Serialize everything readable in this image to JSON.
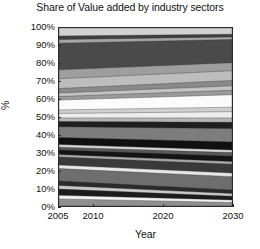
{
  "chart_data": {
    "type": "area",
    "title": "Share of Value added by industry sectors",
    "subtitle": "",
    "xlabel": "Year",
    "ylabel": "%",
    "grid": false,
    "legend_position": "none",
    "stacked": true,
    "normalized_percent": true,
    "xlim": [
      2005,
      2030
    ],
    "ylim": [
      0,
      100
    ],
    "xticks": [
      2005,
      2010,
      2020,
      2030
    ],
    "xtick_labels": [
      "2005",
      "2010",
      "2020",
      "2030"
    ],
    "yticks": [
      0,
      10,
      20,
      30,
      40,
      50,
      60,
      70,
      80,
      90,
      100
    ],
    "ytick_labels": [
      "0%",
      "10%",
      "20%",
      "30%",
      "40%",
      "50%",
      "60%",
      "70%",
      "80%",
      "90%",
      "100%"
    ],
    "x": [
      2005,
      2030
    ],
    "note": "Grayscale stacked percentage area chart; values are cumulative upper boundaries of each band read off the y-axis at the left (2005) and right (2030) edges.",
    "series": [
      {
        "name": "sector-01",
        "color": "#8f8f8f",
        "cum_start": 4.0,
        "cum_end": 2.0
      },
      {
        "name": "sector-02",
        "color": "#f2f2f2",
        "cum_start": 6.0,
        "cum_end": 3.4
      },
      {
        "name": "sector-03",
        "color": "#1c1c1c",
        "cum_start": 9.5,
        "cum_end": 5.5
      },
      {
        "name": "sector-04",
        "color": "#c9c9c9",
        "cum_start": 11.5,
        "cum_end": 7.0
      },
      {
        "name": "sector-05",
        "color": "#2b2b2b",
        "cum_start": 14.0,
        "cum_end": 9.0
      },
      {
        "name": "sector-06",
        "color": "#6e6e6e",
        "cum_start": 21.0,
        "cum_end": 16.5
      },
      {
        "name": "sector-07",
        "color": "#e8e8e8",
        "cum_start": 23.0,
        "cum_end": 18.5
      },
      {
        "name": "sector-08",
        "color": "#3a3a3a",
        "cum_start": 27.5,
        "cum_end": 23.5
      },
      {
        "name": "sector-09",
        "color": "#a8a8a8",
        "cum_start": 29.0,
        "cum_end": 25.0
      },
      {
        "name": "sector-10",
        "color": "#141414",
        "cum_start": 31.5,
        "cum_end": 28.0
      },
      {
        "name": "sector-11",
        "color": "#585858",
        "cum_start": 33.0,
        "cum_end": 30.0
      },
      {
        "name": "sector-12",
        "color": "#d6d6d6",
        "cum_start": 34.5,
        "cum_end": 31.5
      },
      {
        "name": "sector-13",
        "color": "#101010",
        "cum_start": 38.5,
        "cum_end": 36.0
      },
      {
        "name": "sector-14",
        "color": "#7d7d7d",
        "cum_start": 44.5,
        "cum_end": 43.5
      },
      {
        "name": "sector-15",
        "color": "#1f1f1f",
        "cum_start": 47.5,
        "cum_end": 47.0
      },
      {
        "name": "sector-16",
        "color": "#b5b5b5",
        "cum_start": 49.5,
        "cum_end": 49.5
      },
      {
        "name": "sector-17",
        "color": "#ededed",
        "cum_start": 52.0,
        "cum_end": 53.0
      },
      {
        "name": "sector-18",
        "color": "#cfcfcf",
        "cum_start": 54.0,
        "cum_end": 55.5
      },
      {
        "name": "sector-19",
        "color": "#fbfbfb",
        "cum_start": 59.5,
        "cum_end": 62.5
      },
      {
        "name": "sector-20",
        "color": "#9a9a9a",
        "cum_start": 61.5,
        "cum_end": 65.0
      },
      {
        "name": "sector-21",
        "color": "#c2c2c2",
        "cum_start": 63.5,
        "cum_end": 67.5
      },
      {
        "name": "sector-22",
        "color": "#8a8a8a",
        "cum_start": 66.0,
        "cum_end": 70.5
      },
      {
        "name": "sector-23",
        "color": "#bdbdbd",
        "cum_start": 71.5,
        "cum_end": 76.0
      },
      {
        "name": "sector-24",
        "color": "#9e9e9e",
        "cum_start": 76.5,
        "cum_end": 80.5
      },
      {
        "name": "sector-25",
        "color": "#4a4a4a",
        "cum_start": 91.5,
        "cum_end": 93.5
      },
      {
        "name": "sector-26",
        "color": "#a5a5a5",
        "cum_start": 93.5,
        "cum_end": 95.0
      },
      {
        "name": "sector-27",
        "color": "#3f3f3f",
        "cum_start": 95.5,
        "cum_end": 96.5
      },
      {
        "name": "sector-28",
        "color": "#d2d2d2",
        "cum_start": 100.0,
        "cum_end": 100.0
      }
    ]
  },
  "axis": {
    "edge_color": "#2b2b2b",
    "background": "#ffffff"
  }
}
